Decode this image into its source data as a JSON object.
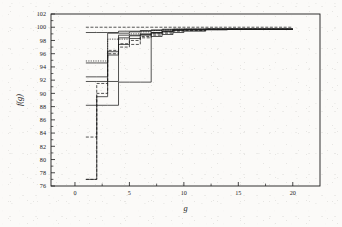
{
  "figure": {
    "background_color": "#fbfaf8",
    "ink_color": "#1c1c1c",
    "x_axis_label": "g",
    "y_axis_label": "f(g)"
  },
  "chart_data": {
    "type": "line",
    "title": "",
    "xlabel": "g",
    "ylabel": "f(g)",
    "xlim": [
      -2.2,
      22.5
    ],
    "ylim": [
      76,
      102
    ],
    "xticks": [
      0,
      5,
      10,
      15,
      20
    ],
    "xtick_labels": [
      "0",
      "5",
      "10",
      "15",
      "20"
    ],
    "yticks": [
      76,
      78,
      80,
      82,
      84,
      86,
      88,
      90,
      92,
      94,
      96,
      98,
      100,
      102
    ],
    "ytick_labels": [
      "76",
      "78",
      "80",
      "82",
      "84",
      "86",
      "88",
      "90",
      "92",
      "94",
      "96",
      "98",
      "100",
      "102"
    ],
    "minor_xticks": [
      2.5,
      7.5,
      12.5,
      17.5
    ],
    "grid": false,
    "legend": false,
    "legend_position": "none",
    "line_color": "#1c1c1c",
    "note": "Ten monotone non-decreasing step/convergence curves rising from g=1 to a common plateau near 99.7-100 by g=12-14.",
    "series": [
      {
        "name": "run-1",
        "style": "dashed",
        "x": [
          1,
          2,
          3,
          4,
          5,
          6,
          7,
          8,
          9,
          10,
          12,
          14,
          16,
          18,
          20
        ],
        "values": [
          100,
          100,
          100,
          100,
          100,
          100,
          100,
          100,
          100,
          100,
          100,
          100,
          100,
          100,
          100
        ]
      },
      {
        "name": "run-2",
        "style": "solid",
        "x": [
          1,
          2,
          3,
          4,
          5,
          6,
          7,
          8,
          9,
          10,
          12,
          14,
          16,
          18,
          20
        ],
        "values": [
          99.2,
          99.2,
          99.2,
          99.4,
          99.4,
          99.5,
          99.6,
          99.7,
          99.7,
          99.7,
          99.7,
          99.7,
          99.7,
          99.7,
          99.7
        ]
      },
      {
        "name": "run-3",
        "style": "solid",
        "x": [
          1,
          2,
          3,
          4,
          5,
          6,
          7,
          8,
          9,
          10,
          12,
          14,
          16,
          18,
          20
        ],
        "values": [
          94.6,
          94.6,
          99.1,
          99.1,
          99.3,
          99.4,
          99.5,
          99.6,
          99.7,
          99.7,
          99.7,
          99.7,
          99.7,
          99.7,
          99.7
        ]
      },
      {
        "name": "run-4",
        "style": "dotted",
        "x": [
          1,
          2,
          3,
          4,
          5,
          6,
          7,
          8,
          9,
          10,
          12,
          14,
          16,
          18,
          20
        ],
        "values": [
          94.9,
          94.9,
          98.2,
          98.2,
          99.0,
          99.3,
          99.5,
          99.6,
          99.7,
          99.7,
          99.7,
          99.7,
          99.7,
          99.7,
          99.7
        ]
      },
      {
        "name": "run-5",
        "style": "solid",
        "x": [
          1,
          2,
          3,
          4,
          5,
          6,
          7,
          8,
          9,
          10,
          12,
          14,
          16,
          18,
          20
        ],
        "values": [
          92.5,
          92.5,
          96.3,
          97.4,
          98.3,
          98.8,
          99.2,
          99.4,
          99.6,
          99.7,
          99.7,
          99.7,
          99.7,
          99.7,
          99.7
        ]
      },
      {
        "name": "run-6",
        "style": "solid",
        "x": [
          1,
          2,
          3,
          4,
          5,
          6,
          7,
          8,
          9,
          10,
          12,
          14,
          16,
          18,
          20
        ],
        "values": [
          91.8,
          91.8,
          91.8,
          98.8,
          98.8,
          99.0,
          99.2,
          99.4,
          99.6,
          99.6,
          99.7,
          99.7,
          99.7,
          99.7,
          99.7
        ]
      },
      {
        "name": "run-7",
        "style": "dashed",
        "x": [
          1,
          2,
          3,
          4,
          5,
          6,
          7,
          8,
          9,
          10,
          12,
          14,
          16,
          18,
          20
        ],
        "values": [
          83.4,
          91.5,
          96.0,
          97.0,
          97.4,
          98.6,
          99.0,
          99.3,
          99.5,
          99.6,
          99.7,
          99.7,
          99.7,
          99.7,
          99.7
        ]
      },
      {
        "name": "run-8",
        "style": "solid",
        "x": [
          1,
          2,
          3,
          4,
          5,
          6,
          7,
          8,
          9,
          10,
          12,
          14,
          16,
          18,
          20
        ],
        "values": [
          88.2,
          88.2,
          88.2,
          91.7,
          91.7,
          91.7,
          98.6,
          98.9,
          99.2,
          99.4,
          99.6,
          99.7,
          99.7,
          99.7,
          99.7
        ]
      },
      {
        "name": "run-9",
        "style": "dashed",
        "x": [
          1,
          2,
          3,
          4,
          5,
          6,
          7,
          8,
          9,
          10,
          12,
          14,
          16,
          18,
          20
        ],
        "values": [
          77.0,
          90.0,
          96.5,
          97.5,
          98.0,
          98.4,
          98.8,
          99.1,
          99.4,
          99.5,
          99.7,
          99.7,
          99.7,
          99.7,
          99.7
        ]
      },
      {
        "name": "run-10",
        "style": "solid",
        "x": [
          1,
          2,
          3,
          4,
          5,
          6,
          7,
          8,
          9,
          10,
          12,
          14,
          16,
          18,
          20
        ],
        "values": [
          77.0,
          89.5,
          95.8,
          98.4,
          98.7,
          98.9,
          99.1,
          99.3,
          99.5,
          99.6,
          99.7,
          99.7,
          99.7,
          99.7,
          99.7
        ]
      }
    ]
  }
}
